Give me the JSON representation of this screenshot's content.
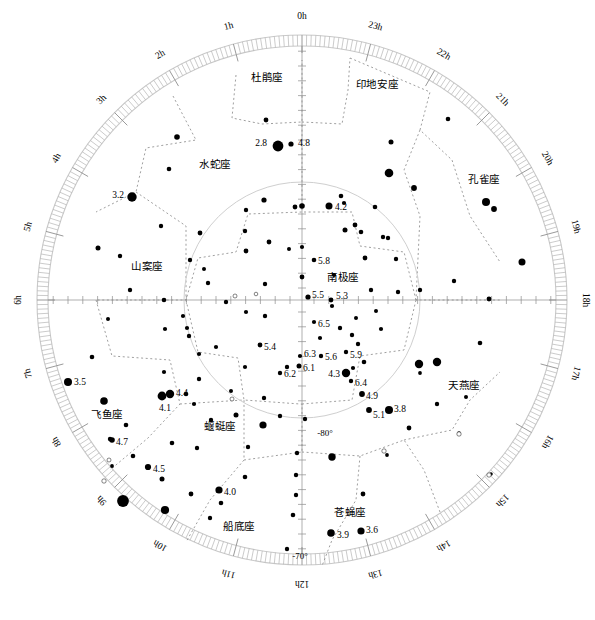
{
  "chart_data": {
    "type": "scatter",
    "projection": "polar-azimuthal",
    "center": {
      "x": 302,
      "y": 300
    },
    "outer_radius": 265,
    "outer_declination": -65,
    "inner_circle_radius": 118,
    "inner_circle_declination": -80,
    "grid": true,
    "legend": "none",
    "xlabel": "赤经 (Right Ascension, hours)",
    "ylabel": "赤纬 (Declination, degrees)",
    "ra_hour_labels": [
      {
        "label": "0h",
        "hour": 0,
        "angle_deg": 0
      },
      {
        "label": "1h",
        "hour": 1,
        "angle_deg": 15
      },
      {
        "label": "2h",
        "hour": 2,
        "angle_deg": 30
      },
      {
        "label": "3h",
        "hour": 3,
        "angle_deg": 45
      },
      {
        "label": "4h",
        "hour": 4,
        "angle_deg": 60
      },
      {
        "label": "5h",
        "hour": 5,
        "angle_deg": 75
      },
      {
        "label": "6h",
        "hour": 6,
        "angle_deg": 90
      },
      {
        "label": "7h",
        "hour": 7,
        "angle_deg": 105
      },
      {
        "label": "8h",
        "hour": 8,
        "angle_deg": 120
      },
      {
        "label": "9h",
        "hour": 9,
        "angle_deg": 135
      },
      {
        "label": "10h",
        "hour": 10,
        "angle_deg": 150
      },
      {
        "label": "11h",
        "hour": 11,
        "angle_deg": 165
      },
      {
        "label": "12h",
        "hour": 12,
        "angle_deg": 180
      },
      {
        "label": "13h",
        "hour": 13,
        "angle_deg": 195
      },
      {
        "label": "14h",
        "hour": 14,
        "angle_deg": 210
      },
      {
        "label": "15h",
        "hour": 15,
        "angle_deg": 225
      },
      {
        "label": "16h",
        "hour": 16,
        "angle_deg": 240
      },
      {
        "label": "17h",
        "hour": 17,
        "angle_deg": 255
      },
      {
        "label": "18h",
        "hour": 18,
        "angle_deg": 270
      },
      {
        "label": "19h",
        "hour": 19,
        "angle_deg": 285
      },
      {
        "label": "20h",
        "hour": 20,
        "angle_deg": 300
      },
      {
        "label": "21h",
        "hour": 21,
        "angle_deg": 315
      },
      {
        "label": "22h",
        "hour": 22,
        "angle_deg": 330
      },
      {
        "label": "23h",
        "hour": 23,
        "angle_deg": 345
      }
    ],
    "declination_labels": [
      {
        "label": "-80°",
        "x": 325,
        "y": 434
      },
      {
        "label": "-70°",
        "x": 300,
        "y": 557
      }
    ],
    "constellations": [
      {
        "name": "杜鹃座",
        "romanization": "Tucana",
        "x": 267,
        "y": 78
      },
      {
        "name": "印地安座",
        "romanization": "Indus",
        "x": 377,
        "y": 85
      },
      {
        "name": "水蛇座",
        "romanization": "Hydrus",
        "x": 215,
        "y": 165
      },
      {
        "name": "孔雀座",
        "romanization": "Pavo",
        "x": 484,
        "y": 180
      },
      {
        "name": "山案座",
        "romanization": "Mensa",
        "x": 147,
        "y": 267
      },
      {
        "name": "南极座",
        "romanization": "Octans",
        "x": 343,
        "y": 278
      },
      {
        "name": "飞鱼座",
        "romanization": "Volans",
        "x": 107,
        "y": 415
      },
      {
        "name": "蝘蜓座",
        "romanization": "Chamaeleon",
        "x": 220,
        "y": 427
      },
      {
        "name": "天燕座",
        "romanization": "Apus",
        "x": 464,
        "y": 386
      },
      {
        "name": "船底座",
        "romanization": "Carina",
        "x": 239,
        "y": 527
      },
      {
        "name": "苍蝇座",
        "romanization": "Musca",
        "x": 350,
        "y": 513
      }
    ],
    "labelled_stars": [
      {
        "mag": "2.8",
        "x": 278,
        "y": 146,
        "r": 5.4,
        "lx": 267,
        "ly": 144,
        "anchor": "end"
      },
      {
        "mag": "4.8",
        "x": 291,
        "y": 144,
        "r": 2.6,
        "lx": 298,
        "ly": 144,
        "anchor": "start"
      },
      {
        "mag": "3.2",
        "x": 132,
        "y": 197,
        "r": 4.7,
        "lx": 124,
        "ly": 196,
        "anchor": "end"
      },
      {
        "mag": "4.2",
        "x": 329,
        "y": 206,
        "r": 3.5,
        "lx": 335,
        "ly": 208,
        "anchor": "start"
      },
      {
        "mag": "5.8",
        "x": 314,
        "y": 260,
        "r": 2.3,
        "lx": 318,
        "ly": 262,
        "anchor": "start"
      },
      {
        "mag": "5.5",
        "x": 308,
        "y": 297,
        "r": 2.6,
        "lx": 312,
        "ly": 296,
        "anchor": "start"
      },
      {
        "mag": "5.3",
        "x": 331,
        "y": 300,
        "r": 2.4,
        "lx": 336,
        "ly": 297,
        "anchor": "start"
      },
      {
        "mag": "6.5",
        "x": 314,
        "y": 322,
        "r": 2.1,
        "lx": 318,
        "ly": 325,
        "anchor": "start"
      },
      {
        "mag": "5.4",
        "x": 260,
        "y": 345,
        "r": 2.4,
        "lx": 264,
        "ly": 348,
        "anchor": "start"
      },
      {
        "mag": "6.3",
        "x": 300,
        "y": 356,
        "r": 2.1,
        "lx": 304,
        "ly": 355,
        "anchor": "start"
      },
      {
        "mag": "5.6",
        "x": 321,
        "y": 356,
        "r": 2.2,
        "lx": 325,
        "ly": 358,
        "anchor": "start"
      },
      {
        "mag": "5.9",
        "x": 346,
        "y": 352,
        "r": 2.2,
        "lx": 350,
        "ly": 356,
        "anchor": "start"
      },
      {
        "mag": "6.1",
        "x": 299,
        "y": 366,
        "r": 2.5,
        "lx": 303,
        "ly": 369,
        "anchor": "start"
      },
      {
        "mag": "6.2",
        "x": 280,
        "y": 373,
        "r": 2.2,
        "lx": 284,
        "ly": 375,
        "anchor": "start"
      },
      {
        "mag": "4.3",
        "x": 346,
        "y": 373,
        "r": 4.2,
        "lx": 340,
        "ly": 375,
        "anchor": "end"
      },
      {
        "mag": "6.4",
        "x": 351,
        "y": 381,
        "r": 2.2,
        "lx": 355,
        "ly": 384,
        "anchor": "start"
      },
      {
        "mag": "4.9",
        "x": 362,
        "y": 394,
        "r": 2.9,
        "lx": 366,
        "ly": 397,
        "anchor": "start"
      },
      {
        "mag": "5.1",
        "x": 369,
        "y": 410,
        "r": 2.9,
        "lx": 373,
        "ly": 416,
        "anchor": "start"
      },
      {
        "mag": "3.8",
        "x": 389,
        "y": 410,
        "r": 4.0,
        "lx": 394,
        "ly": 410,
        "anchor": "start"
      },
      {
        "mag": "3.5",
        "x": 68,
        "y": 382,
        "r": 4.0,
        "lx": 74,
        "ly": 383,
        "anchor": "start"
      },
      {
        "mag": "4.4",
        "x": 170,
        "y": 394,
        "r": 4.2,
        "lx": 176,
        "ly": 394,
        "anchor": "start"
      },
      {
        "mag": "4.1",
        "x": 162,
        "y": 396,
        "r": 4.4,
        "lx": 165,
        "ly": 409,
        "anchor": "middle"
      },
      {
        "mag": "4.7",
        "x": 112,
        "y": 440,
        "r": 2.8,
        "lx": 116,
        "ly": 443,
        "anchor": "start"
      },
      {
        "mag": "4.5",
        "x": 148,
        "y": 467,
        "r": 3.1,
        "lx": 153,
        "ly": 470,
        "anchor": "start"
      },
      {
        "mag": "4.0",
        "x": 219,
        "y": 490,
        "r": 3.6,
        "lx": 224,
        "ly": 493,
        "anchor": "start"
      },
      {
        "mag": "3.9",
        "x": 331,
        "y": 533,
        "r": 3.8,
        "lx": 337,
        "ly": 536,
        "anchor": "start"
      },
      {
        "mag": "3.6",
        "x": 361,
        "y": 531,
        "r": 3.6,
        "lx": 366,
        "ly": 531,
        "anchor": "start"
      }
    ],
    "plain_stars": [
      {
        "x": 266,
        "y": 120,
        "r": 2.4
      },
      {
        "x": 177,
        "y": 137,
        "r": 2.8
      },
      {
        "x": 169,
        "y": 169,
        "r": 2.3
      },
      {
        "x": 391,
        "y": 142,
        "r": 2.5
      },
      {
        "x": 448,
        "y": 119,
        "r": 2.3
      },
      {
        "x": 389,
        "y": 173,
        "r": 4.3
      },
      {
        "x": 414,
        "y": 188,
        "r": 2.9
      },
      {
        "x": 486,
        "y": 202,
        "r": 4.0
      },
      {
        "x": 494,
        "y": 209,
        "r": 2.9
      },
      {
        "x": 264,
        "y": 200,
        "r": 2.6
      },
      {
        "x": 246,
        "y": 210,
        "r": 2.2
      },
      {
        "x": 344,
        "y": 203,
        "r": 2.1
      },
      {
        "x": 302,
        "y": 206,
        "r": 2.8
      },
      {
        "x": 295,
        "y": 207,
        "r": 2.4
      },
      {
        "x": 375,
        "y": 207,
        "r": 2.3
      },
      {
        "x": 98,
        "y": 248,
        "r": 2.5
      },
      {
        "x": 120,
        "y": 256,
        "r": 2.2
      },
      {
        "x": 190,
        "y": 260,
        "r": 2.2
      },
      {
        "x": 204,
        "y": 269,
        "r": 2.0
      },
      {
        "x": 130,
        "y": 290,
        "r": 2.2
      },
      {
        "x": 164,
        "y": 300,
        "r": 2.3
      },
      {
        "x": 108,
        "y": 319,
        "r": 2.0
      },
      {
        "x": 165,
        "y": 329,
        "r": 2.1
      },
      {
        "x": 187,
        "y": 328,
        "r": 2.1
      },
      {
        "x": 245,
        "y": 231,
        "r": 2.2
      },
      {
        "x": 246,
        "y": 251,
        "r": 2.4
      },
      {
        "x": 269,
        "y": 242,
        "r": 2.4
      },
      {
        "x": 289,
        "y": 249,
        "r": 2.0
      },
      {
        "x": 302,
        "y": 247,
        "r": 2.1
      },
      {
        "x": 302,
        "y": 277,
        "r": 2.4
      },
      {
        "x": 265,
        "y": 284,
        "r": 2.2
      },
      {
        "x": 265,
        "y": 316,
        "r": 2.2
      },
      {
        "x": 341,
        "y": 196,
        "r": 2.3
      },
      {
        "x": 361,
        "y": 232,
        "r": 2.3
      },
      {
        "x": 355,
        "y": 225,
        "r": 2.4
      },
      {
        "x": 345,
        "y": 230,
        "r": 2.5
      },
      {
        "x": 383,
        "y": 237,
        "r": 2.2
      },
      {
        "x": 388,
        "y": 238,
        "r": 2.2
      },
      {
        "x": 365,
        "y": 258,
        "r": 2.4
      },
      {
        "x": 396,
        "y": 259,
        "r": 2.2
      },
      {
        "x": 334,
        "y": 275,
        "r": 2.1
      },
      {
        "x": 371,
        "y": 290,
        "r": 2.2
      },
      {
        "x": 398,
        "y": 292,
        "r": 2.2
      },
      {
        "x": 332,
        "y": 306,
        "r": 2.1
      },
      {
        "x": 340,
        "y": 328,
        "r": 2.2
      },
      {
        "x": 356,
        "y": 318,
        "r": 2.0
      },
      {
        "x": 376,
        "y": 311,
        "r": 2.0
      },
      {
        "x": 381,
        "y": 329,
        "r": 2.1
      },
      {
        "x": 358,
        "y": 344,
        "r": 2.2
      },
      {
        "x": 364,
        "y": 362,
        "r": 2.3
      },
      {
        "x": 353,
        "y": 368,
        "r": 2.1
      },
      {
        "x": 419,
        "y": 364,
        "r": 4.2
      },
      {
        "x": 437,
        "y": 362,
        "r": 4.2
      },
      {
        "x": 420,
        "y": 373,
        "r": 1.9
      },
      {
        "x": 480,
        "y": 343,
        "r": 2.3
      },
      {
        "x": 437,
        "y": 404,
        "r": 2.2
      },
      {
        "x": 466,
        "y": 397,
        "r": 2.0
      },
      {
        "x": 409,
        "y": 428,
        "r": 2.4
      },
      {
        "x": 459,
        "y": 433,
        "r": 1.8
      },
      {
        "x": 491,
        "y": 474,
        "r": 1.8
      },
      {
        "x": 522,
        "y": 262,
        "r": 3.5
      },
      {
        "x": 489,
        "y": 299,
        "r": 2.4
      },
      {
        "x": 454,
        "y": 281,
        "r": 2.2
      },
      {
        "x": 420,
        "y": 290,
        "r": 2.2
      },
      {
        "x": 332,
        "y": 457,
        "r": 3.7
      },
      {
        "x": 297,
        "y": 453,
        "r": 2.2
      },
      {
        "x": 296,
        "y": 475,
        "r": 2.2
      },
      {
        "x": 296,
        "y": 495,
        "r": 2.2
      },
      {
        "x": 363,
        "y": 494,
        "r": 2.4
      },
      {
        "x": 387,
        "y": 455,
        "r": 1.9
      },
      {
        "x": 293,
        "y": 515,
        "r": 2.3
      },
      {
        "x": 287,
        "y": 549,
        "r": 2.2
      },
      {
        "x": 245,
        "y": 477,
        "r": 2.3
      },
      {
        "x": 221,
        "y": 503,
        "r": 2.3
      },
      {
        "x": 210,
        "y": 518,
        "r": 2.2
      },
      {
        "x": 191,
        "y": 494,
        "r": 2.4
      },
      {
        "x": 162,
        "y": 479,
        "r": 2.5
      },
      {
        "x": 165,
        "y": 510,
        "r": 4.1
      },
      {
        "x": 133,
        "y": 456,
        "r": 2.3
      },
      {
        "x": 123,
        "y": 501,
        "r": 5.9
      },
      {
        "x": 112,
        "y": 466,
        "r": 1.9
      },
      {
        "x": 110,
        "y": 439,
        "r": 2.2
      },
      {
        "x": 126,
        "y": 425,
        "r": 2.3
      },
      {
        "x": 92,
        "y": 357,
        "r": 2.3
      },
      {
        "x": 104,
        "y": 401,
        "r": 3.8
      },
      {
        "x": 186,
        "y": 394,
        "r": 2.3
      },
      {
        "x": 194,
        "y": 404,
        "r": 2.1
      },
      {
        "x": 199,
        "y": 379,
        "r": 2.2
      },
      {
        "x": 164,
        "y": 372,
        "r": 2.1
      },
      {
        "x": 211,
        "y": 420,
        "r": 2.2
      },
      {
        "x": 236,
        "y": 415,
        "r": 2.5
      },
      {
        "x": 231,
        "y": 391,
        "r": 2.0
      },
      {
        "x": 264,
        "y": 398,
        "r": 2.2
      },
      {
        "x": 248,
        "y": 447,
        "r": 2.2
      },
      {
        "x": 197,
        "y": 448,
        "r": 2.2
      },
      {
        "x": 172,
        "y": 443,
        "r": 2.3
      },
      {
        "x": 263,
        "y": 425,
        "r": 3.6
      },
      {
        "x": 287,
        "y": 367,
        "r": 2.2
      },
      {
        "x": 245,
        "y": 367,
        "r": 2.1
      },
      {
        "x": 216,
        "y": 347,
        "r": 2.1
      },
      {
        "x": 199,
        "y": 354,
        "r": 2.1
      },
      {
        "x": 189,
        "y": 336,
        "r": 2.2
      },
      {
        "x": 320,
        "y": 338,
        "r": 2.1
      },
      {
        "x": 352,
        "y": 335,
        "r": 2.2
      },
      {
        "x": 305,
        "y": 419,
        "r": 2.2
      },
      {
        "x": 280,
        "y": 416,
        "r": 2.2
      },
      {
        "x": 246,
        "y": 312,
        "r": 2.1
      },
      {
        "x": 226,
        "y": 302,
        "r": 2.2
      },
      {
        "x": 208,
        "y": 283,
        "r": 2.2
      },
      {
        "x": 183,
        "y": 316,
        "r": 2.1
      },
      {
        "x": 200,
        "y": 233,
        "r": 2.4
      },
      {
        "x": 161,
        "y": 226,
        "r": 2.2
      }
    ],
    "open_stars": [
      {
        "x": 235,
        "y": 296,
        "r": 2.0
      },
      {
        "x": 256,
        "y": 294,
        "r": 1.8
      },
      {
        "x": 232,
        "y": 399,
        "r": 2.0
      },
      {
        "x": 384,
        "y": 451,
        "r": 2.2
      },
      {
        "x": 104,
        "y": 481,
        "r": 2.2
      },
      {
        "x": 459,
        "y": 434,
        "r": 2.2
      },
      {
        "x": 489,
        "y": 475,
        "r": 2.2
      },
      {
        "x": 109,
        "y": 460,
        "r": 2.0
      }
    ]
  }
}
